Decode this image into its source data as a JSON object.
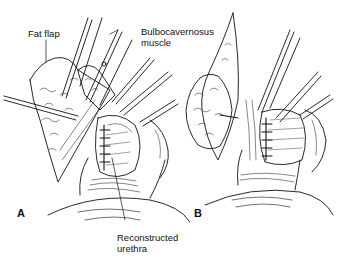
{
  "figure": {
    "type": "surgical line illustration",
    "panels": [
      {
        "id": "A",
        "label": "A"
      },
      {
        "id": "B",
        "label": "B"
      }
    ],
    "annotations": [
      {
        "id": "fat-flap",
        "text": "Fat flap"
      },
      {
        "id": "bulbocavernosus-line1",
        "text": "Bulbocavernosus"
      },
      {
        "id": "bulbocavernosus-line2",
        "text": "muscle"
      },
      {
        "id": "reconstructed-line1",
        "text": "Reconstructed"
      },
      {
        "id": "reconstructed-line2",
        "text": "urethra"
      }
    ],
    "colors": {
      "ink": "#111111",
      "background": "#ffffff"
    }
  }
}
